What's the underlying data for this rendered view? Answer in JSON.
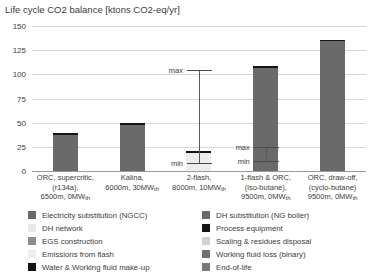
{
  "chart_data": {
    "type": "bar",
    "title": "Life cycle CO2 balance [ktons CO2-eq/yr]",
    "xlabel": "",
    "ylabel": "",
    "ylim": [
      0,
      150
    ],
    "yticks": [
      0,
      25,
      50,
      75,
      100,
      125,
      150
    ],
    "ytick_labels": [
      "0",
      "25",
      "50",
      "75",
      "100",
      "125",
      "150"
    ],
    "grid": true,
    "legend_position": "bottom",
    "stacked": true,
    "categories": [
      "ORC, supercritic, (r134a), 6500m, 0MWth",
      "Kalina, 6000m, 30MWth",
      "2-flash, 8000m, 10MWth",
      "1-flash & ORC, (iso-butane), 9500m, 0MWth",
      "ORC, draw-off, (cyclo-butane) 9500m, 0MWth"
    ],
    "category_lines": [
      [
        "ORC, supercritic,",
        "(r134a),",
        "6500m, 0MW",
        "th"
      ],
      [
        "Kalina,",
        "6000m, 30MW",
        "th"
      ],
      [
        "2-flash,",
        "8000m, 10MW",
        "th"
      ],
      [
        "1-flash & ORC,",
        "(iso-butane),",
        "9500m, 0MW",
        "th"
      ],
      [
        "ORC, draw-off,",
        "(cyclo-butane)",
        "9500m, 0MW",
        "th"
      ]
    ],
    "series": [
      {
        "name": "Electricity substitution (NGCC)",
        "color": "#6a6a6a",
        "values": [
          37,
          48,
          0,
          107,
          134
        ]
      },
      {
        "name": "DH substitution (NG boiler)",
        "color": "#6a6a6a",
        "values": [
          0,
          0,
          0,
          0,
          0
        ]
      },
      {
        "name": "DH network",
        "color": "#e8e8e8",
        "values": [
          0,
          0,
          0,
          0,
          0
        ]
      },
      {
        "name": "Process equipment",
        "color": "#141414",
        "values": [
          0,
          0,
          0,
          0,
          0
        ]
      },
      {
        "name": "EGS construction",
        "color": "#8c8c8c",
        "values": [
          0,
          0,
          0,
          0,
          0
        ]
      },
      {
        "name": "Scaling & residues disposal",
        "color": "#d2d2d2",
        "values": [
          0,
          0,
          0,
          0,
          0
        ]
      },
      {
        "name": "Emissions from flash",
        "color": "#ededed",
        "values": [
          0,
          0,
          19,
          0,
          0
        ]
      },
      {
        "name": "Working fluid loss (binary)",
        "color": "#707070",
        "values": [
          0,
          0,
          0,
          0,
          0
        ]
      },
      {
        "name": "Water & Working fluid make-up",
        "color": "#141414",
        "values": [
          2,
          2,
          2,
          2,
          2
        ]
      },
      {
        "name": "End-of-life",
        "color": "#7a7a7a",
        "values": [
          0,
          0,
          0,
          0,
          0
        ]
      }
    ],
    "bar_totals": [
      39,
      50,
      21,
      109,
      136
    ],
    "error_bars": [
      {
        "category_index": 2,
        "min": 8,
        "max": 105,
        "min_label": "min",
        "max_label": "max"
      },
      {
        "category_index": 3,
        "min": 10,
        "max": 25,
        "min_label": "min",
        "max_label": "max"
      }
    ],
    "legend_columns": {
      "left": [
        {
          "label": "Electricity substitution (NGCC)",
          "color": "#6a6a6a"
        },
        {
          "label": "DH network",
          "color": "#e8e8e8"
        },
        {
          "label": "EGS construction",
          "color": "#8c8c8c"
        },
        {
          "label": "Emissions from flash",
          "color": "#ededed"
        },
        {
          "label": "Water & Working fluid make-up",
          "color": "#141414"
        }
      ],
      "right": [
        {
          "label": "DH substitution (NG boiler)",
          "color": "#6a6a6a"
        },
        {
          "label": "Process equipment",
          "color": "#141414"
        },
        {
          "label": "Scaling & residues disposal",
          "color": "#d2d2d2"
        },
        {
          "label": "Working fluid loss (binary)",
          "color": "#707070"
        },
        {
          "label": "End-of-life",
          "color": "#7a7a7a"
        }
      ]
    }
  }
}
